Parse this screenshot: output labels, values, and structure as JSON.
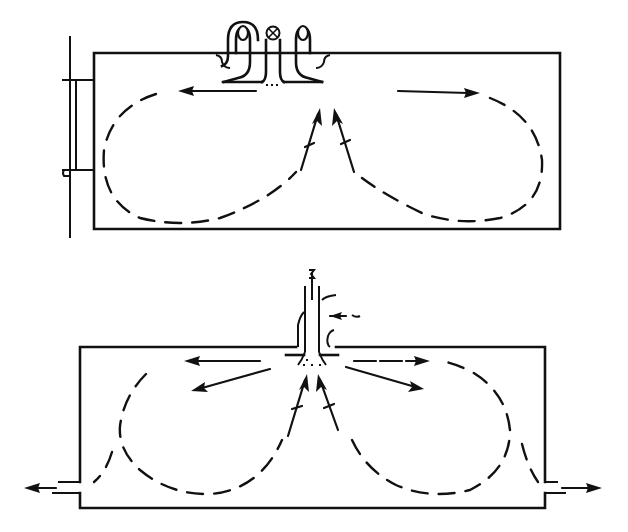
{
  "figure": {
    "type": "airflow-diagram",
    "line_color": "#111111",
    "background": "#ffffff"
  },
  "panels": [
    {
      "id": "top",
      "label": "",
      "elements": {
        "room": "rectangular room section",
        "window": "window on left wall",
        "diffuser": "ceiling diffuser with central induction pipe (marked ⊗) and two side supply pipes",
        "supply_jets": [
          "horizontal jet to left",
          "horizontal jet to right"
        ],
        "return_flow": [
          "upward induced flow into diffuser center (two arrows)"
        ],
        "circulation": [
          "left recirculation loop",
          "right recirculation loop"
        ]
      },
      "symbols": {
        "center_marker": "⊗"
      }
    },
    {
      "id": "bottom",
      "label": "",
      "elements": {
        "room": "rectangular room section",
        "diffuser": "ceiling diffuser with vertical supply pipe",
        "supply_jets": [
          "horizontal jet left",
          "downward-angled jet left",
          "horizontal jet right",
          "downward-angled jet right"
        ],
        "return_flow": [
          "upward induced flow into diffuser center (two arrows)"
        ],
        "exhaust": [
          "left exhaust outlet at floor level",
          "right exhaust outlet at floor level"
        ],
        "circulation": [
          "left recirculation loop",
          "right recirculation loop"
        ]
      }
    }
  ],
  "caption": ""
}
